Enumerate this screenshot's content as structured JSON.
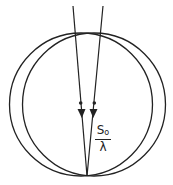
{
  "diagram": {
    "type": "ewald-sphere-construction",
    "stroke_color": "#222222",
    "background": "#ffffff",
    "circles": [
      {
        "name": "left-sphere",
        "cx": 81,
        "cy": 104.5,
        "r": 71.5
      },
      {
        "name": "right-sphere",
        "cx": 94,
        "cy": 104.5,
        "r": 71.5
      }
    ],
    "beams": [
      {
        "name": "left-beam",
        "x1": 73,
        "y1": 6,
        "x2": 87,
        "y2": 176,
        "dot": [
          81,
          103
        ],
        "arrow_y": 110
      },
      {
        "name": "right-beam",
        "x1": 103,
        "y1": 6,
        "x2": 87,
        "y2": 176,
        "dot": [
          94,
          103
        ],
        "arrow_y": 110
      }
    ],
    "label": {
      "numerator": "S",
      "numerator_sub": "o",
      "denominator": "λ"
    }
  }
}
